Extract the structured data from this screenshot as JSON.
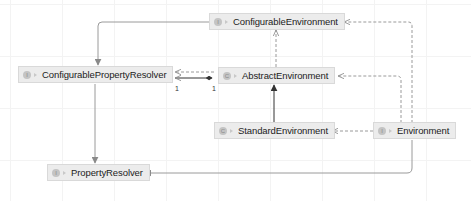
{
  "diagram": {
    "type": "uml-class-diagram",
    "nodes": [
      {
        "id": "configurable-environment",
        "name": "ConfigurableEnvironment",
        "kind": "interface",
        "kind_glyph": "I"
      },
      {
        "id": "configurable-property-resolver",
        "name": "ConfigurablePropertyResolver",
        "kind": "interface",
        "kind_glyph": "I"
      },
      {
        "id": "abstract-environment",
        "name": "AbstractEnvironment",
        "kind": "abstract-class",
        "kind_glyph": "C"
      },
      {
        "id": "standard-environment",
        "name": "StandardEnvironment",
        "kind": "class",
        "kind_glyph": "C"
      },
      {
        "id": "environment",
        "name": "Environment",
        "kind": "interface",
        "kind_glyph": "I"
      },
      {
        "id": "property-resolver",
        "name": "PropertyResolver",
        "kind": "interface",
        "kind_glyph": "I"
      }
    ],
    "edges": [
      {
        "from": "ConfigurableEnvironment",
        "to": "ConfigurablePropertyResolver",
        "type": "extends"
      },
      {
        "from": "ConfigurablePropertyResolver",
        "to": "PropertyResolver",
        "type": "extends"
      },
      {
        "from": "AbstractEnvironment",
        "to": "ConfigurableEnvironment",
        "type": "implements"
      },
      {
        "from": "AbstractEnvironment",
        "to": "ConfigurablePropertyResolver",
        "type": "implements"
      },
      {
        "from": "AbstractEnvironment",
        "to": "ConfigurablePropertyResolver",
        "type": "composition",
        "multiplicity_source": "1",
        "multiplicity_target": "1"
      },
      {
        "from": "StandardEnvironment",
        "to": "AbstractEnvironment",
        "type": "extends"
      },
      {
        "from": "Environment",
        "to": "StandardEnvironment",
        "type": "implements"
      },
      {
        "from": "Environment",
        "to": "AbstractEnvironment",
        "type": "implements"
      },
      {
        "from": "Environment",
        "to": "ConfigurableEnvironment",
        "type": "implements"
      },
      {
        "from": "Environment",
        "to": "PropertyResolver",
        "type": "extends"
      }
    ],
    "multiplicity": {
      "left": "1",
      "right": "1"
    }
  }
}
